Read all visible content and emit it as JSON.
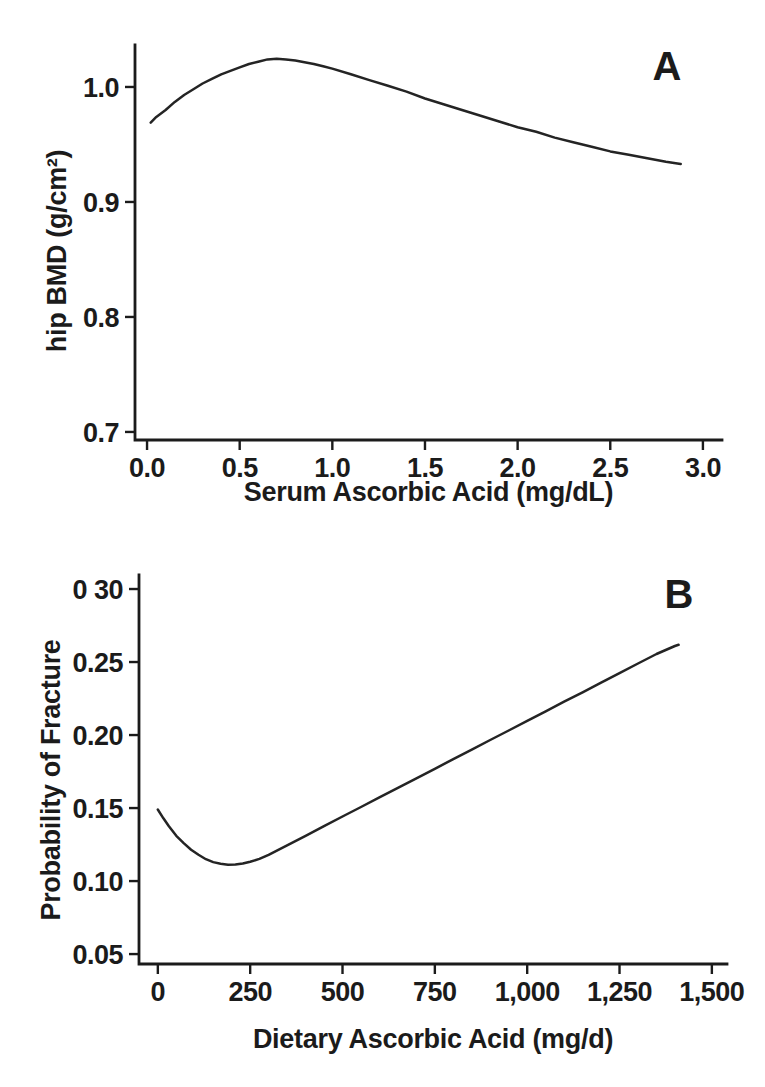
{
  "page": {
    "background": "#ffffff",
    "ink": "#1b1b1b"
  },
  "chart_data": [
    {
      "panel_label": "A",
      "type": "line",
      "title": "",
      "xlabel": "Serum Ascorbic Acid (mg/dL)",
      "ylabel": "hip BMD (g/cm²)",
      "grid": false,
      "legend": "none",
      "xlim": [
        -0.065,
        3.103
      ],
      "ylim": [
        0.693,
        1.0365
      ],
      "x_ticks": {
        "values": [
          0.0,
          0.5,
          1.0,
          1.5,
          2.0,
          2.5,
          3.0
        ],
        "labels": [
          "0.0",
          "0.5",
          "1.0",
          "1.5",
          "2.0",
          "2.5",
          "3.0"
        ]
      },
      "y_ticks": {
        "values": [
          0.7,
          0.8,
          0.9,
          1.0
        ],
        "labels": [
          "0.7",
          "0.8",
          "0.9",
          "1.0"
        ]
      },
      "series": [
        {
          "name": "hip BMD vs serum ascorbic acid (smoothed curve)",
          "x": [
            0.02,
            0.05,
            0.1,
            0.15,
            0.2,
            0.25,
            0.3,
            0.35,
            0.4,
            0.45,
            0.5,
            0.55,
            0.6,
            0.65,
            0.7,
            0.75,
            0.8,
            0.85,
            0.9,
            0.95,
            1.0,
            1.1,
            1.2,
            1.3,
            1.4,
            1.5,
            1.6,
            1.7,
            1.8,
            1.9,
            2.0,
            2.1,
            2.2,
            2.3,
            2.4,
            2.5,
            2.6,
            2.7,
            2.8,
            2.88
          ],
          "y": [
            0.969,
            0.974,
            0.98,
            0.987,
            0.993,
            0.998,
            1.003,
            1.007,
            1.011,
            1.014,
            1.017,
            1.02,
            1.022,
            1.024,
            1.0245,
            1.024,
            1.023,
            1.0215,
            1.02,
            1.018,
            1.016,
            1.011,
            1.006,
            1.001,
            0.996,
            0.99,
            0.985,
            0.98,
            0.975,
            0.97,
            0.965,
            0.961,
            0.956,
            0.952,
            0.948,
            0.944,
            0.941,
            0.938,
            0.935,
            0.933
          ]
        }
      ]
    },
    {
      "panel_label": "B",
      "type": "line",
      "title": "",
      "xlabel": "Dietary Ascorbic Acid (mg/d)",
      "ylabel": "Probability of Fracture",
      "grid": false,
      "legend": "none",
      "xlim": [
        -51,
        1541
      ],
      "ylim": [
        0.0432,
        0.3096
      ],
      "x_ticks": {
        "values": [
          0,
          250,
          500,
          750,
          1000,
          1250,
          1500
        ],
        "labels": [
          "0",
          "250",
          "500",
          "750",
          "1,000",
          "1,250",
          "1,500"
        ]
      },
      "y_ticks": {
        "values": [
          0.05,
          0.1,
          0.15,
          0.2,
          0.25,
          0.3
        ],
        "labels": [
          "0.05",
          "0.10",
          "0.15",
          "0.20",
          "0.25",
          "0 30"
        ]
      },
      "series": [
        {
          "name": "probability of fracture vs dietary ascorbic acid (smoothed curve)",
          "x": [
            0,
            15,
            30,
            50,
            70,
            90,
            110,
            130,
            150,
            170,
            190,
            210,
            230,
            250,
            275,
            300,
            350,
            400,
            450,
            500,
            550,
            600,
            650,
            700,
            750,
            800,
            850,
            900,
            950,
            1000,
            1050,
            1100,
            1150,
            1200,
            1250,
            1300,
            1350,
            1400,
            1410
          ],
          "y": [
            0.149,
            0.143,
            0.1375,
            0.131,
            0.126,
            0.1215,
            0.118,
            0.115,
            0.113,
            0.1118,
            0.1112,
            0.1113,
            0.112,
            0.1132,
            0.1152,
            0.118,
            0.1245,
            0.131,
            0.1376,
            0.1442,
            0.1507,
            0.1573,
            0.1638,
            0.1704,
            0.1769,
            0.1835,
            0.19,
            0.1966,
            0.2031,
            0.2097,
            0.2162,
            0.2228,
            0.2293,
            0.2359,
            0.2424,
            0.249,
            0.2555,
            0.261,
            0.2618
          ]
        }
      ]
    }
  ]
}
